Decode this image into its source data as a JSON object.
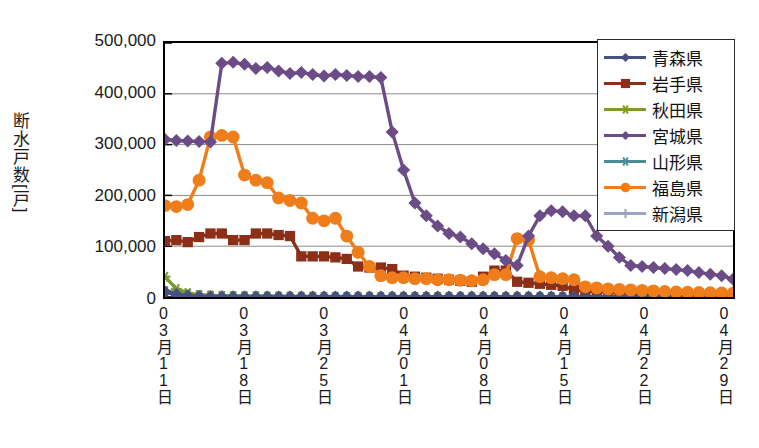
{
  "chart_data": {
    "type": "line",
    "title": "",
    "xlabel": "",
    "ylabel": "断水戸数[戸]",
    "ylim": [
      0,
      500000
    ],
    "ytick_labels": [
      "500,000",
      "400,000",
      "300,000",
      "200,000",
      "100,000",
      "0"
    ],
    "ytick_values": [
      500000,
      400000,
      300000,
      200000,
      100000,
      0
    ],
    "grid": "horizontal",
    "legend_position": "top-right",
    "x_tick_labels": [
      "03月11日",
      "03月18日",
      "03月25日",
      "04月01日",
      "04月08日",
      "04月15日",
      "04月22日",
      "04月29日"
    ],
    "x_tick_indices": [
      0,
      7,
      14,
      21,
      28,
      35,
      42,
      49
    ],
    "x": [
      "03月11日",
      "03月12日",
      "03月13日",
      "03月14日",
      "03月15日",
      "03月16日",
      "03月17日",
      "03月18日",
      "03月19日",
      "03月20日",
      "03月21日",
      "03月22日",
      "03月23日",
      "03月24日",
      "03月25日",
      "03月26日",
      "03月27日",
      "03月28日",
      "03月29日",
      "03月30日",
      "03月31日",
      "04月01日",
      "04月02日",
      "04月03日",
      "04月04日",
      "04月05日",
      "04月06日",
      "04月07日",
      "04月08日",
      "04月09日",
      "04月10日",
      "04月11日",
      "04月12日",
      "04月13日",
      "04月14日",
      "04月15日",
      "04月16日",
      "04月17日",
      "04月18日",
      "04月19日",
      "04月20日",
      "04月21日",
      "04月22日",
      "04月23日",
      "04月24日",
      "04月25日",
      "04月26日",
      "04月27日",
      "04月28日",
      "04月29日",
      "04月30日"
    ],
    "series": [
      {
        "name": "青森県",
        "color": "#46517E",
        "marker": "diamond",
        "values": [
          10000,
          5000,
          2000,
          800,
          400,
          200,
          100,
          60,
          40,
          20,
          10,
          0,
          0,
          0,
          0,
          0,
          0,
          0,
          0,
          0,
          0,
          0,
          0,
          0,
          0,
          0,
          0,
          0,
          0,
          0,
          0,
          0,
          0,
          0,
          0,
          0,
          0,
          0,
          0,
          0,
          0,
          0,
          0,
          0,
          0,
          0,
          0,
          0,
          0,
          0,
          0
        ]
      },
      {
        "name": "岩手県",
        "color": "#8C2F18",
        "marker": "square",
        "values": [
          110000,
          112000,
          108000,
          118000,
          125000,
          125000,
          112000,
          112000,
          125000,
          125000,
          122000,
          120000,
          80000,
          80000,
          80000,
          78000,
          75000,
          60000,
          58000,
          58000,
          55000,
          42000,
          40000,
          38000,
          36000,
          34000,
          32000,
          30000,
          40000,
          52000,
          52000,
          30000,
          28000,
          26000,
          24000,
          22000,
          14000,
          12000,
          10000,
          9000,
          8000,
          7000,
          6000,
          5500,
          5000,
          4500,
          4000,
          3500,
          3000,
          2800,
          2500
        ]
      },
      {
        "name": "秋田県",
        "color": "#7D9A2C",
        "marker": "star",
        "values": [
          40000,
          16000,
          8000,
          4000,
          2500,
          2000,
          1500,
          1200,
          1000,
          900,
          800,
          700,
          600,
          500,
          450,
          400,
          380,
          350,
          320,
          300,
          280,
          260,
          240,
          220,
          200,
          190,
          180,
          170,
          160,
          150,
          140,
          130,
          120,
          110,
          100,
          95,
          90,
          85,
          80,
          75,
          70,
          65,
          60,
          55,
          50,
          48,
          45,
          42,
          40,
          38,
          35
        ]
      },
      {
        "name": "宮城県",
        "color": "#6B4C86",
        "marker": "diamond",
        "values": [
          310000,
          308000,
          307000,
          306000,
          305000,
          460000,
          462000,
          458000,
          450000,
          452000,
          445000,
          440000,
          442000,
          438000,
          435000,
          438000,
          436000,
          434000,
          434000,
          432000,
          325000,
          250000,
          185000,
          160000,
          140000,
          125000,
          118000,
          105000,
          95000,
          85000,
          72000,
          62000,
          120000,
          160000,
          170000,
          168000,
          160000,
          160000,
          120000,
          100000,
          78000,
          62000,
          60000,
          58000,
          56000,
          54000,
          52000,
          48000,
          45000,
          42000,
          35000
        ]
      },
      {
        "name": "山形県",
        "color": "#4C8C97",
        "marker": "x",
        "values": [
          12000,
          9000,
          6000,
          4000,
          3000,
          2500,
          2000,
          1800,
          1600,
          1400,
          1200,
          1000,
          900,
          800,
          700,
          650,
          600,
          550,
          500,
          450,
          420,
          400,
          380,
          360,
          340,
          320,
          300,
          280,
          260,
          250,
          240,
          230,
          220,
          210,
          200,
          190,
          180,
          170,
          160,
          150,
          140,
          130,
          120,
          110,
          100,
          95,
          90,
          85,
          80,
          75,
          70
        ]
      },
      {
        "name": "福島県",
        "color": "#EF7D1A",
        "marker": "circle",
        "values": [
          180000,
          178000,
          182000,
          230000,
          315000,
          318000,
          315000,
          240000,
          230000,
          225000,
          195000,
          190000,
          185000,
          155000,
          150000,
          155000,
          120000,
          88000,
          60000,
          42000,
          38000,
          38000,
          36000,
          36000,
          34000,
          34000,
          33000,
          32000,
          34000,
          44000,
          44000,
          115000,
          112000,
          40000,
          38000,
          36000,
          34000,
          20000,
          18000,
          16000,
          15000,
          14000,
          13000,
          12000,
          11000,
          10000,
          9500,
          9000,
          8500,
          8000,
          7500
        ]
      },
      {
        "name": "新潟県",
        "color": "#9BA4C4",
        "marker": "plus",
        "values": [
          8000,
          6000,
          4000,
          3000,
          2500,
          2200,
          2000,
          1800,
          1600,
          1500,
          1400,
          1300,
          1200,
          1100,
          1000,
          950,
          900,
          850,
          800,
          750,
          700,
          680,
          650,
          620,
          600,
          580,
          560,
          540,
          520,
          500,
          480,
          460,
          440,
          420,
          400,
          390,
          380,
          370,
          360,
          350,
          340,
          330,
          320,
          310,
          300,
          290,
          280,
          270,
          260,
          250,
          240
        ]
      }
    ]
  },
  "legend": {
    "items": [
      {
        "label": "青森県",
        "color": "#46517E",
        "marker": "diamond"
      },
      {
        "label": "岩手県",
        "color": "#8C2F18",
        "marker": "square"
      },
      {
        "label": "秋田県",
        "color": "#7D9A2C",
        "marker": "star"
      },
      {
        "label": "宮城県",
        "color": "#6B4C86",
        "marker": "diamond"
      },
      {
        "label": "山形県",
        "color": "#4C8C97",
        "marker": "x"
      },
      {
        "label": "福島県",
        "color": "#EF7D1A",
        "marker": "circle"
      },
      {
        "label": "新潟県",
        "color": "#9BA4C4",
        "marker": "plus"
      }
    ]
  }
}
